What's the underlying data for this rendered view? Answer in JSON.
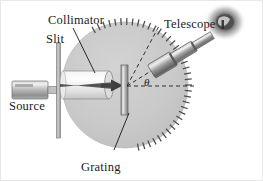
{
  "figure": {
    "background_color": "#ffffff",
    "labels": {
      "collimator": "Collimator",
      "slit": "Slit",
      "telescope": "Telescope",
      "source": "Source",
      "grating": "Grating",
      "angle": "θ"
    },
    "colors": {
      "table_disc": "#c9c9c9",
      "table_disc_edge": "#b4b4b4",
      "metal_light": "#e3e3e3",
      "metal_mid": "#a8a8a8",
      "metal_dark": "#6e6e6e",
      "beam_dark": "#4a4a4a",
      "ink": "#1a1a1a",
      "eyepiece": "#3a3a3a"
    },
    "components": {
      "source": {
        "name": "Source",
        "shape": "cylinder",
        "orientation": "horizontal"
      },
      "slit": {
        "name": "Slit",
        "shape": "vertical-bar"
      },
      "collimator": {
        "name": "Collimator",
        "shape": "horizontal-tube-with-lens"
      },
      "grating": {
        "name": "Grating",
        "shape": "vertical-plate",
        "position": "disc-center"
      },
      "telescope": {
        "name": "Telescope",
        "shape": "tapered-tube-with-eyepiece",
        "orientation": "up-right"
      },
      "table": {
        "name": "Rotating table with angular scale",
        "shape": "circle",
        "tick_marks": true
      }
    },
    "annotations": {
      "angle_between": "incident beam axis and telescope axis",
      "dashed_lines": [
        "telescope optical axis",
        "undeviated beam axis",
        "zero-order reference line"
      ]
    }
  }
}
